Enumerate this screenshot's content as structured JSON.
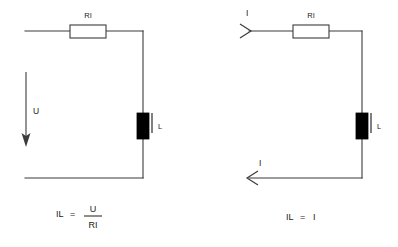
{
  "figure": {
    "stroke_color": "#3b3b3b",
    "text_color": "#1a1a1a",
    "background_color": "#ffffff",
    "inductor_fill": "#000000"
  },
  "left_circuit": {
    "name": "voltage-source-circuit",
    "resistor_label": "RI",
    "source_label": "U",
    "inductor_label": "L",
    "formula": {
      "lhs": "IL",
      "equals": "=",
      "numerator": "U",
      "denominator": "RI"
    }
  },
  "right_circuit": {
    "name": "current-source-circuit",
    "resistor_label": "RI",
    "inductor_label": "L",
    "current_in_label": "I",
    "current_out_label": "I",
    "formula": {
      "lhs": "IL",
      "equals": "=",
      "rhs": "I"
    }
  }
}
